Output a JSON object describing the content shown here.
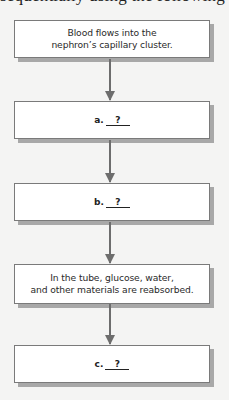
{
  "header": {
    "cutoff_text": "sequentially using the following graphic"
  },
  "flowchart": {
    "steps": [
      {
        "id": "step-1",
        "text": "Blood flows into the\nnephron’s capillary cluster.",
        "type": "given"
      },
      {
        "id": "step-a",
        "label": "a.",
        "blank": "?",
        "type": "blank"
      },
      {
        "id": "step-b",
        "label": "b.",
        "blank": "?",
        "type": "blank"
      },
      {
        "id": "step-4",
        "text": "In the tube, glucose, water,\nand other materials are reabsorbed.",
        "type": "given"
      },
      {
        "id": "step-c",
        "label": "c.",
        "blank": "?",
        "type": "blank"
      }
    ],
    "colors": {
      "box_border": "#7a7a7a",
      "box_shadow": "#a8a8a8",
      "arrow": "#6d6d6d",
      "background": "#f4f4f3"
    }
  }
}
